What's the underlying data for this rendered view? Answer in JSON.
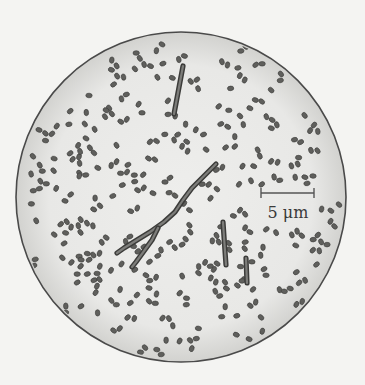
{
  "figure": {
    "field_of_view": {
      "cx": 181,
      "cy": 197,
      "r": 165,
      "fill": "#e9e9e7",
      "edge_shade": "#cfcfcc",
      "border": "#4a4a4a"
    },
    "scale_bar": {
      "label": "5 μm",
      "x1": 261,
      "x2": 314,
      "y": 193,
      "tick": 5,
      "label_x": 288,
      "label_y": 203,
      "color": "#555555"
    },
    "cocci": {
      "count": 330,
      "seed": 7,
      "color": "#5f5f5c",
      "stroke": "#3e3e3c",
      "rx": 3.2,
      "ry": 2.3
    },
    "rods": [
      {
        "name": "rod-top",
        "points": [
          [
            183,
            66
          ],
          [
            174,
            114
          ]
        ],
        "width": 4
      },
      {
        "name": "rod-center-right",
        "points": [
          [
            223,
            222
          ],
          [
            224.5,
            244
          ],
          [
            226,
            265
          ]
        ],
        "width": 4
      },
      {
        "name": "rod-short-right",
        "points": [
          [
            246,
            258
          ],
          [
            247,
            283
          ]
        ],
        "width": 4
      }
    ],
    "filaments": [
      {
        "name": "filament-main",
        "points": [
          [
            216,
            164
          ],
          [
            205,
            175
          ],
          [
            192,
            188
          ],
          [
            183,
            200
          ],
          [
            175,
            212
          ],
          [
            164,
            222
          ],
          [
            150,
            232
          ],
          [
            137,
            240
          ],
          [
            124,
            248
          ],
          [
            117,
            253
          ]
        ],
        "width": 4
      },
      {
        "name": "filament-branch",
        "points": [
          [
            158,
            228
          ],
          [
            152,
            240
          ],
          [
            144,
            251
          ],
          [
            136,
            262
          ],
          [
            132,
            267
          ]
        ],
        "width": 4
      }
    ]
  }
}
